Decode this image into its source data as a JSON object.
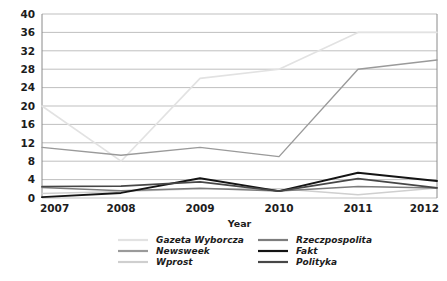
{
  "chart_data": {
    "type": "line",
    "title": "",
    "xlabel": "Year",
    "ylabel": "",
    "x": [
      2007,
      2008,
      2009,
      2010,
      2011,
      2012
    ],
    "categories": [
      "2007",
      "2008",
      "2009",
      "2010",
      "2011",
      "2012"
    ],
    "ylim": [
      0,
      40
    ],
    "yticks": [
      0,
      4,
      8,
      12,
      16,
      20,
      24,
      28,
      32,
      36,
      40
    ],
    "ytick_labels": [
      "0",
      "4",
      "8",
      "12",
      "16",
      "20",
      "24",
      "28",
      "32",
      "36",
      "40"
    ],
    "xtick_labels": [
      "2007",
      "2008",
      "2009",
      "2010",
      "2011",
      "2012"
    ],
    "grid": true,
    "grid_axis": "y",
    "legend_position": "bottom",
    "legend_columns": 2,
    "series": [
      {
        "name": "Gazeta Wyborcza",
        "color": "#e2e2e2",
        "width": 1.6,
        "values": [
          20.0,
          8.0,
          26.0,
          28.0,
          36.0,
          36.0
        ]
      },
      {
        "name": "Newsweek",
        "color": "#9a9a9a",
        "width": 1.4,
        "values": [
          11.0,
          9.3,
          11.0,
          9.0,
          28.0,
          30.0
        ]
      },
      {
        "name": "Wprost",
        "color": "#cfcfcf",
        "width": 1.5,
        "values": [
          1.0,
          1.4,
          2.0,
          2.0,
          0.7,
          2.2
        ]
      },
      {
        "name": "Rzeczpospolita",
        "color": "#7d7d7d",
        "width": 1.5,
        "values": [
          2.3,
          1.6,
          2.1,
          1.5,
          2.5,
          2.2
        ]
      },
      {
        "name": "Fakt",
        "color": "#141414",
        "width": 1.9,
        "values": [
          0.2,
          1.1,
          4.3,
          1.5,
          5.5,
          3.7
        ]
      },
      {
        "name": "Polityka",
        "color": "#474747",
        "width": 1.7,
        "values": [
          2.5,
          2.6,
          3.5,
          1.5,
          4.2,
          2.2
        ]
      }
    ]
  },
  "legend": {
    "entries": [
      {
        "label": "Gazeta Wyborcza",
        "color": "#e2e2e2"
      },
      {
        "label": "Rzeczpospolita",
        "color": "#7d7d7d"
      },
      {
        "label": "Newsweek",
        "color": "#9a9a9a"
      },
      {
        "label": "Fakt",
        "color": "#141414"
      },
      {
        "label": "Wprost",
        "color": "#cfcfcf"
      },
      {
        "label": "Polityka",
        "color": "#474747"
      }
    ]
  },
  "style": {
    "background": "#ffffff",
    "grid_color": "#b8b8b8",
    "frame_color": "#8a8a8a",
    "text_color": "#1c1c1c"
  }
}
